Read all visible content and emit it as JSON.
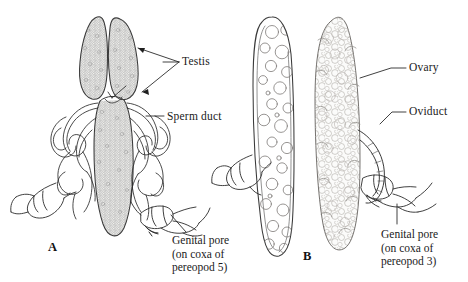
{
  "figure": {
    "background_color": "#ffffff",
    "ink_color": "#2b2b2b",
    "width": 468,
    "height": 282
  },
  "panels": [
    {
      "id": "A",
      "letter": "A",
      "sex": "male",
      "labels": [
        {
          "name": "testis",
          "text": "Testis",
          "leader": "forked pointer to both testis lobes"
        },
        {
          "name": "sperm-duct",
          "text": "Sperm duct",
          "leader": "straight pointer to coiled duct"
        },
        {
          "name": "genital-pore",
          "lines": [
            "Genital pore",
            "(on coxa of",
            "pereopod 5)"
          ],
          "leader": "short diagonal pointer to coxa"
        }
      ]
    },
    {
      "id": "B",
      "letter": "B",
      "sex": "female",
      "labels": [
        {
          "name": "ovary",
          "text": "Ovary",
          "leader": "bent pointer to right ovary"
        },
        {
          "name": "oviduct",
          "text": "Oviduct",
          "leader": "bent pointer to oviduct"
        },
        {
          "name": "genital-pore",
          "lines": [
            "Genital pore",
            "(on coxa of",
            "pereopod 3)"
          ],
          "leader": "vertical pointer to coxa"
        }
      ]
    }
  ],
  "text": {
    "testis": "Testis",
    "sperm_duct": "Sperm duct",
    "ovary": "Ovary",
    "oviduct": "Oviduct",
    "genital_pore_a_line1": "Genital pore",
    "genital_pore_a_line2": "(on coxa of",
    "genital_pore_a_line3": "pereopod 5)",
    "genital_pore_b_line1": "Genital pore",
    "genital_pore_b_line2": "(on coxa of",
    "genital_pore_b_line3": "pereopod 3)",
    "panel_a": "A",
    "panel_b": "B"
  }
}
